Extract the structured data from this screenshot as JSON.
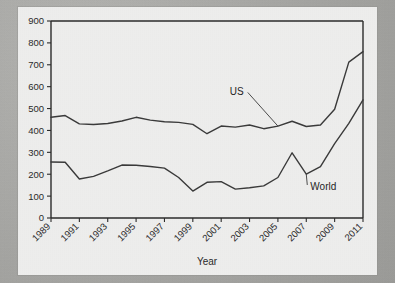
{
  "chart_data": {
    "type": "line",
    "title": "",
    "xlabel": "Year",
    "ylabel": "",
    "xlim": [
      1989,
      2011
    ],
    "ylim": [
      0,
      900
    ],
    "ytick_step": 100,
    "grid": false,
    "legend_position": "inline-annotations",
    "x": [
      1989,
      1990,
      1991,
      1992,
      1993,
      1994,
      1995,
      1996,
      1997,
      1998,
      1999,
      2000,
      2001,
      2002,
      2003,
      2004,
      2005,
      2006,
      2007,
      2008,
      2009,
      2010,
      2011
    ],
    "xtick_labels": [
      "1989",
      "1991",
      "1993",
      "1995",
      "1997",
      "1999",
      "2001",
      "2003",
      "2005",
      "2007",
      "2009",
      "2011"
    ],
    "ytick_labels": [
      "0",
      "100",
      "200",
      "300",
      "400",
      "500",
      "600",
      "700",
      "800",
      "900"
    ],
    "series": [
      {
        "name": "US",
        "values": [
          460,
          468,
          430,
          427,
          432,
          443,
          460,
          447,
          440,
          437,
          428,
          385,
          420,
          415,
          425,
          408,
          420,
          442,
          418,
          425,
          497,
          712,
          760
        ]
      },
      {
        "name": "World",
        "values": [
          256,
          255,
          178,
          190,
          215,
          242,
          241,
          235,
          228,
          185,
          123,
          163,
          166,
          132,
          138,
          147,
          185,
          298,
          200,
          235,
          340,
          432,
          540
        ]
      }
    ],
    "annotations": [
      {
        "text": "US",
        "x": 2002.1,
        "y": 560
      },
      {
        "text": "World",
        "x": 2008.2,
        "y": 128
      }
    ]
  },
  "axis": {
    "x_title": "Year"
  }
}
